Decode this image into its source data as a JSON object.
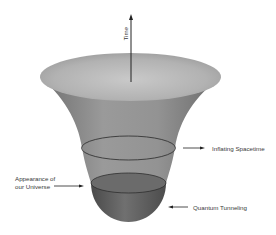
{
  "diagram": {
    "labels": {
      "time": "Time",
      "inflating": "Inflating Spacetime",
      "appearance_line1": "Appearance of",
      "appearance_line2": "our Universe",
      "tunneling": "Quantum Tunneling"
    },
    "colors": {
      "funnel_top": "#b8b8b8",
      "funnel_body": "#8a8a8a",
      "bowl": "#5e5e5e",
      "arrow": "#222222",
      "text": "#3a3a3a"
    }
  }
}
